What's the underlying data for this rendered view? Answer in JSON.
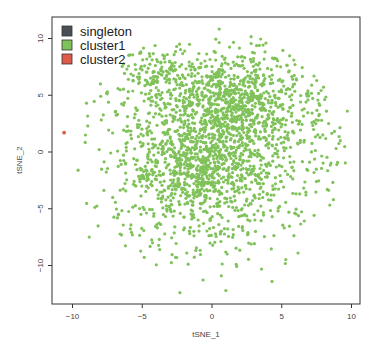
{
  "chart_data": {
    "type": "scatter",
    "title": "",
    "xlabel": "tSNE_1",
    "ylabel": "tSNE_2",
    "xlim": [
      -11.5,
      10.6
    ],
    "ylim": [
      -13.5,
      11.9
    ],
    "xticks": [
      -10,
      -5,
      0,
      5,
      10
    ],
    "yticks": [
      -10,
      -5,
      0,
      5,
      10
    ],
    "xtick_labels": [
      "−10",
      "−5",
      "0",
      "5",
      "10"
    ],
    "ytick_labels": [
      "−10",
      "−5",
      "0",
      "5",
      "10"
    ],
    "grid": false,
    "legend_position": "top-left inside",
    "legend": [
      {
        "label": "singleton",
        "color": "#4a4f55"
      },
      {
        "label": "cluster1",
        "color": "#80c25a"
      },
      {
        "label": "cluster2",
        "color": "#e05a4a"
      }
    ],
    "series": [
      {
        "name": "singleton",
        "color": "#4a4f55",
        "points": []
      },
      {
        "name": "cluster1",
        "color": "#80c25a",
        "approx_count": 2300,
        "description": "dense green cloud spanning roughly x -9.5..9.5, y -12.5..11 with density peaks near (1,4.5), (-1,-1.5) and (-4,7)",
        "generator_components": [
          {
            "cx": 1.2,
            "cy": 4.6,
            "sx": 2.3,
            "sy": 1.8,
            "n": 520
          },
          {
            "cx": -1.0,
            "cy": -1.6,
            "sx": 2.4,
            "sy": 2.2,
            "n": 560
          },
          {
            "cx": -4.0,
            "cy": 7.0,
            "sx": 1.1,
            "sy": 0.9,
            "n": 90
          },
          {
            "cx": 0.0,
            "cy": 0.5,
            "sx": 4.6,
            "sy": 5.2,
            "n": 900
          },
          {
            "cx": 3.5,
            "cy": 2.0,
            "sx": 3.4,
            "sy": 3.6,
            "n": 230
          }
        ],
        "outliers": [
          [
            -9.0,
            4.3
          ],
          [
            -8.9,
            2.3
          ],
          [
            -8.0,
            6.0
          ],
          [
            -9.6,
            -1.6
          ],
          [
            -8.8,
            -7.5
          ],
          [
            9.7,
            3.6
          ],
          [
            8.7,
            -4.2
          ],
          [
            9.2,
            1.0
          ],
          [
            -2.3,
            -12.4
          ],
          [
            1.0,
            -12.2
          ],
          [
            4.3,
            -11.4
          ]
        ]
      },
      {
        "name": "cluster2",
        "color": "#e05a4a",
        "points": [
          [
            -10.6,
            1.7
          ]
        ]
      }
    ]
  }
}
